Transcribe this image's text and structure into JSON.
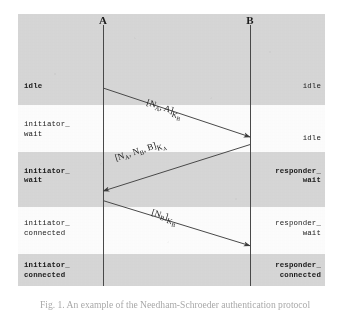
{
  "figure": {
    "actors": [
      {
        "name": "A",
        "x_pct": 27.7
      },
      {
        "name": "B",
        "x_pct": 75.6
      }
    ],
    "bands": [
      {
        "shaded": true,
        "top_pct": 0.0,
        "height_pct": 33.5
      },
      {
        "shaded": false,
        "top_pct": 33.5,
        "height_pct": 17.3
      },
      {
        "shaded": true,
        "top_pct": 50.8,
        "height_pct": 20.2
      },
      {
        "shaded": false,
        "top_pct": 71.0,
        "height_pct": 17.3
      },
      {
        "shaded": true,
        "top_pct": 88.3,
        "height_pct": 11.7
      }
    ],
    "left_states": [
      {
        "text": "idle",
        "bold": true,
        "top_pct": 25.0
      },
      {
        "text": "initiator_\nwait",
        "bold": false,
        "top_pct": 39.0
      },
      {
        "text": "initiator_\nwait",
        "bold": true,
        "top_pct": 56.2
      },
      {
        "text": "initiator_\nconnected",
        "bold": false,
        "top_pct": 75.5
      },
      {
        "text": "initiator_\nconnected",
        "bold": true,
        "top_pct": 90.8
      }
    ],
    "right_states": [
      {
        "text": "idle",
        "bold": false,
        "top_pct": 25.0
      },
      {
        "text": "idle",
        "bold": false,
        "top_pct": 44.0
      },
      {
        "text": "responder_\nwait",
        "bold": true,
        "top_pct": 56.2
      },
      {
        "text": "responder_\nwait",
        "bold": false,
        "top_pct": 75.5
      },
      {
        "text": "responder_\nconnected",
        "bold": true,
        "top_pct": 90.8
      }
    ],
    "messages": [
      {
        "id": "msg-1",
        "from": "A",
        "to": "B",
        "label_plain": "[N_A, A]K_B",
        "label_parts": {
          "open": "[N",
          "sub1": "A",
          "mid": ", A]",
          "key": "K",
          "keysub": "B"
        },
        "x1_pct": 27.7,
        "y1_pct": 27.2,
        "x2_pct": 75.6,
        "y2_pct": 45.2,
        "label_left_pct": 42.0,
        "label_top_pct": 30.5
      },
      {
        "id": "msg-2",
        "from": "B",
        "to": "A",
        "label_plain": "[N_A, N_B, B]K_A",
        "label_parts": {
          "open": "[N",
          "sub1": "A",
          "mid": ", N",
          "sub2": "B",
          "mid2": ", B]",
          "key": "K",
          "keysub": "A"
        },
        "x1_pct": 75.6,
        "y1_pct": 48.0,
        "x2_pct": 27.7,
        "y2_pct": 65.1,
        "label_left_pct": 31.5,
        "label_top_pct": 51.0
      },
      {
        "id": "msg-3",
        "from": "A",
        "to": "B",
        "label_plain": "[N_B]K_B",
        "label_parts": {
          "open": "[N",
          "sub1": "B",
          "mid": "]",
          "key": "K",
          "keysub": "B"
        },
        "x1_pct": 27.7,
        "y1_pct": 68.6,
        "x2_pct": 75.6,
        "y2_pct": 85.2,
        "label_left_pct": 43.5,
        "label_top_pct": 71.0
      }
    ],
    "lifelines": [
      {
        "actor": "A",
        "x_pct": 27.7,
        "top_pct": 4.0,
        "height_pct": 96.0
      },
      {
        "actor": "B",
        "x_pct": 75.6,
        "top_pct": 4.0,
        "height_pct": 96.0
      }
    ]
  },
  "caption": {
    "text": "Fig. 1. An example of the Needham-Schroeder authentication protocol"
  },
  "colors": {
    "band_shaded": "#d9d9d9",
    "band_plain": "#ffffff",
    "ink": "#1a1a1a",
    "line": "#4a4a4a",
    "caption": "#5f5f5f"
  }
}
